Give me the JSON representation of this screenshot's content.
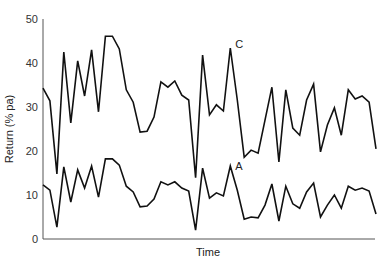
{
  "chart_data": {
    "type": "line",
    "title": "",
    "xlabel": "Time",
    "ylabel": "Return (% pa)",
    "ylim": [
      0,
      50
    ],
    "yticks": [
      0,
      10,
      20,
      30,
      40,
      50
    ],
    "grid": false,
    "legend": "inline labels at series peaks",
    "x": [
      1,
      2,
      3,
      4,
      5,
      6,
      7,
      8,
      9,
      10,
      11,
      12,
      13,
      14,
      15,
      16,
      17,
      18,
      19,
      20,
      21,
      22,
      23,
      24,
      25,
      26,
      27,
      28,
      29,
      30,
      31,
      32,
      33,
      34,
      35,
      36,
      37,
      38,
      39,
      40,
      41,
      42,
      43,
      44,
      45,
      46,
      47,
      48,
      49
    ],
    "series": [
      {
        "name": "C",
        "values": [
          34.3,
          31.4,
          14.8,
          42.5,
          26.4,
          40.5,
          32.5,
          43.0,
          28.9,
          46.1,
          46.1,
          43.2,
          33.9,
          31.1,
          24.3,
          24.5,
          27.7,
          35.7,
          34.5,
          35.9,
          32.7,
          31.6,
          13.9,
          41.8,
          28.2,
          30.5,
          29.1,
          43.4,
          31.6,
          18.6,
          20.2,
          19.5,
          27.0,
          34.5,
          17.5,
          33.9,
          25.2,
          23.6,
          31.6,
          35.2,
          19.8,
          25.9,
          29.8,
          23.6,
          33.9,
          31.8,
          32.5,
          31.1,
          20.5
        ],
        "label_at_index": 27
      },
      {
        "name": "A",
        "values": [
          12.3,
          11.1,
          2.7,
          16.4,
          8.4,
          15.7,
          11.6,
          16.6,
          9.5,
          18.2,
          18.2,
          16.8,
          12.0,
          10.7,
          7.3,
          7.5,
          9.1,
          13.0,
          12.3,
          13.0,
          11.6,
          10.9,
          2.0,
          16.1,
          9.3,
          10.5,
          9.8,
          16.6,
          11.1,
          4.5,
          5.0,
          4.8,
          7.7,
          12.5,
          4.1,
          12.0,
          8.0,
          7.0,
          10.7,
          12.7,
          5.0,
          7.7,
          10.0,
          7.0,
          12.0,
          11.1,
          11.6,
          10.9,
          5.7
        ],
        "label_at_index": 27
      }
    ]
  },
  "axes": {
    "y_tick_labels": [
      "0",
      "10",
      "20",
      "30",
      "40",
      "50"
    ],
    "x_label": "Time",
    "y_label": "Return (% pa)"
  },
  "style": {
    "line_color": "#111111",
    "axis_color": "#555555"
  }
}
